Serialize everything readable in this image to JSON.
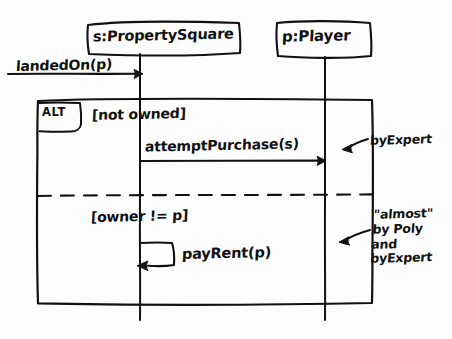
{
  "diagram": {
    "kind": "uml-sequence-diagram",
    "style": "hand-drawn-sketch",
    "background_color": "#fdfdfd",
    "ink_color": "#111111"
  },
  "lifelines": [
    {
      "id": "property-square",
      "label": "s:PropertySquare",
      "role": "object",
      "x": 140
    },
    {
      "id": "player",
      "label": "p:Player",
      "role": "object",
      "x": 325
    }
  ],
  "found_message": {
    "label": "landedOn(p)",
    "from": "left-edge",
    "to": "property-square",
    "arrow": "solid-filled"
  },
  "combined_fragment": {
    "operator": "ALT",
    "alternatives": [
      {
        "guard": "[not owned]",
        "messages": [
          {
            "label": "attemptPurchase(s)",
            "from": "property-square",
            "to": "player",
            "arrow": "solid-filled",
            "kind": "call"
          }
        ],
        "annotation": {
          "text": "byExpert",
          "lines": [
            "byExpert"
          ],
          "pointer": "curved-arrow-left"
        }
      },
      {
        "guard": "[owner != p]",
        "messages": [
          {
            "label": "payRent(p)",
            "from": "property-square",
            "to": "property-square",
            "arrow": "solid-filled",
            "kind": "self-call"
          }
        ],
        "annotation": {
          "text": "\"almost\" by Poly and byExpert",
          "lines": [
            "\"almost\"",
            "by Poly",
            "and",
            "byExpert"
          ],
          "pointer": "curved-arrow-left"
        }
      }
    ]
  }
}
